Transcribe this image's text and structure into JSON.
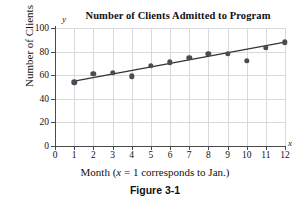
{
  "chart_data": {
    "type": "scatter",
    "title": "Number of Clients Admitted to Program",
    "xlabel": "Month (x = 1 corresponds to Jan.)",
    "ylabel": "Number of Clients",
    "x_axis_variable": "x",
    "y_axis_variable": "y",
    "xlim": [
      0,
      12
    ],
    "ylim": [
      0,
      100
    ],
    "grid": true,
    "legend": "none",
    "x": [
      1,
      2,
      3,
      4,
      5,
      6,
      7,
      8,
      9,
      10,
      11,
      12
    ],
    "values": [
      54,
      61,
      62,
      59,
      68,
      71,
      75,
      78,
      78,
      72,
      83,
      88
    ],
    "xticks": [
      "0",
      "1",
      "2",
      "3",
      "4",
      "5",
      "6",
      "7",
      "8",
      "9",
      "10",
      "11",
      "12"
    ],
    "yticks": [
      "0",
      "20",
      "40",
      "60",
      "80",
      "100"
    ],
    "series": [
      {
        "name": "Clients admitted",
        "marker": "filled-circle",
        "color": "#4b4b55",
        "values": [
          54,
          61,
          62,
          59,
          68,
          71,
          75,
          78,
          78,
          72,
          83,
          88
        ]
      },
      {
        "name": "Trend line",
        "type": "line",
        "color": "#333333",
        "endpoints": [
          {
            "x": 1,
            "y": 55
          },
          {
            "x": 12,
            "y": 88
          }
        ]
      }
    ],
    "annotations": []
  },
  "caption": {
    "figure_label": "Figure 3-1"
  }
}
